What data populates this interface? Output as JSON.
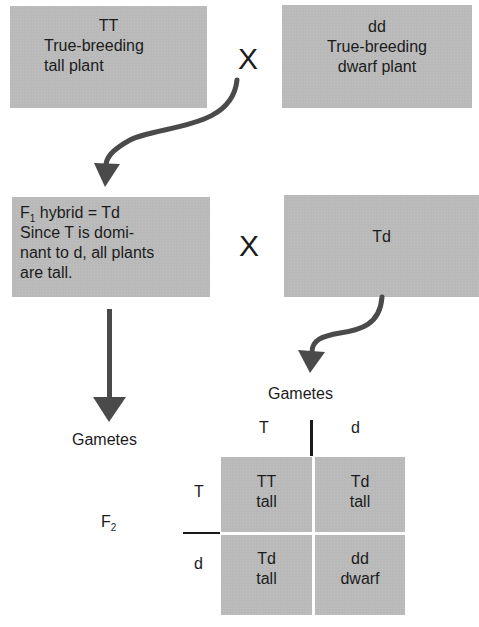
{
  "parent_generation": {
    "left_box": {
      "genotype": "TT",
      "line1": "True-breeding",
      "line2": "tall plant"
    },
    "right_box": {
      "genotype": "dd",
      "line1": "True-breeding",
      "line2": "dwarf plant"
    },
    "cross_symbol": "X"
  },
  "f1_generation": {
    "left_box": {
      "line1_prefix": "F",
      "line1_subscript": "1",
      "line1_suffix": " hybrid = Td",
      "line2": "Since T is domi-",
      "line3": "nant to d, all plants",
      "line4": "are tall."
    },
    "right_box": {
      "genotype": "Td"
    },
    "cross_symbol": "X"
  },
  "gametes_labels": {
    "left": "Gametes",
    "right": "Gametes"
  },
  "punnett_square": {
    "generation_label_prefix": "F",
    "generation_label_subscript": "2",
    "column_headers": [
      "T",
      "d"
    ],
    "row_headers": [
      "T",
      "d"
    ],
    "cells": [
      [
        {
          "genotype": "TT",
          "phenotype": "tall"
        },
        {
          "genotype": "Td",
          "phenotype": "tall"
        }
      ],
      [
        {
          "genotype": "Td",
          "phenotype": "tall"
        },
        {
          "genotype": "dd",
          "phenotype": "dwarf"
        }
      ]
    ]
  },
  "colors": {
    "box_fill": "#b9b9b9",
    "arrow": "#4a4a4a",
    "text": "#1c1c1c"
  }
}
